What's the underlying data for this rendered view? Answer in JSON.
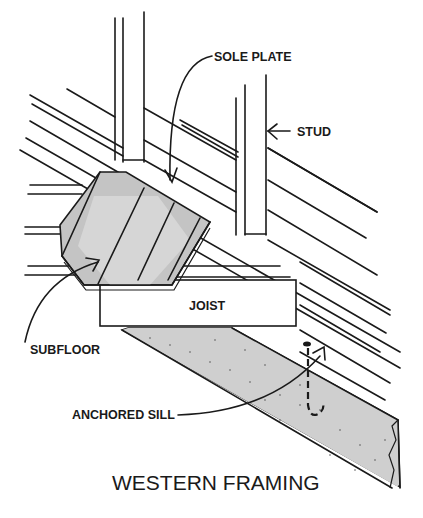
{
  "diagram": {
    "title": "WESTERN FRAMING",
    "labels": {
      "sole_plate": "SOLE PLATE",
      "stud": "STUD",
      "joist": "JOIST",
      "subfloor": "SUBFLOOR",
      "anchored_sill": "ANCHORED SILL"
    },
    "colors": {
      "line": "#1a1a1a",
      "subfloor_fill": "#c8c8c8",
      "subfloor_light": "#d6d6d6",
      "concrete_fill": "#cfcfcf",
      "background": "#ffffff"
    }
  }
}
